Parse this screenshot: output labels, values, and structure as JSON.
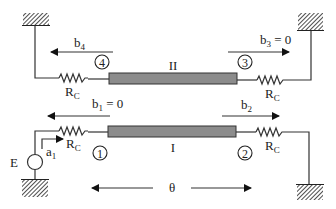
{
  "diagram": {
    "type": "coupled transmission line circuit",
    "lines": [
      {
        "id": "line-II",
        "label": "II"
      },
      {
        "id": "line-I",
        "label": "I"
      }
    ],
    "ports": [
      {
        "number": "1",
        "wave_out": {
          "base": "b",
          "sub": "1",
          "suffix": " = 0"
        }
      },
      {
        "number": "2",
        "wave_out": {
          "base": "b",
          "sub": "2",
          "suffix": ""
        }
      },
      {
        "number": "3",
        "wave_out": {
          "base": "b",
          "sub": "3",
          "suffix": " = 0"
        }
      },
      {
        "number": "4",
        "wave_out": {
          "base": "b",
          "sub": "4",
          "suffix": ""
        }
      }
    ],
    "resistor_label": {
      "base": "R",
      "sub": "C"
    },
    "source": {
      "label": "E",
      "incident": {
        "base": "a",
        "sub": "1"
      }
    },
    "electrical_length": "θ",
    "colors": {
      "line_fill": "#8c8c8c",
      "stroke": "#333333"
    }
  }
}
